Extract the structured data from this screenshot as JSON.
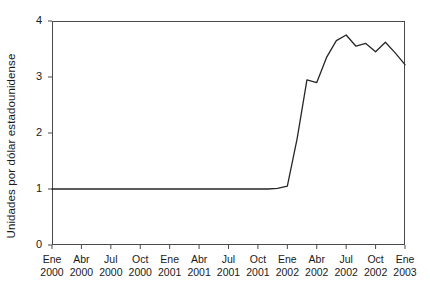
{
  "chart_data": {
    "type": "line",
    "title": "",
    "xlabel": "",
    "ylabel": "Unidades por dólar estadounidense",
    "ylim": [
      0,
      4
    ],
    "yticks": [
      0,
      1,
      2,
      3,
      4
    ],
    "ytick_labels": [
      "0",
      "1",
      "2",
      "3",
      "4"
    ],
    "grid": false,
    "legend": "none",
    "x_tick_labels": [
      {
        "month": "Ene",
        "year": "2000"
      },
      {
        "month": "Abr",
        "year": "2000"
      },
      {
        "month": "Jul",
        "year": "2000"
      },
      {
        "month": "Oct",
        "year": "2000"
      },
      {
        "month": "Ene",
        "year": "2001"
      },
      {
        "month": "Abr",
        "year": "2001"
      },
      {
        "month": "Jul",
        "year": "2001"
      },
      {
        "month": "Oct",
        "year": "2001"
      },
      {
        "month": "Ene",
        "year": "2002"
      },
      {
        "month": "Abr",
        "year": "2002"
      },
      {
        "month": "Jul",
        "year": "2002"
      },
      {
        "month": "Oct",
        "year": "2002"
      },
      {
        "month": "Ene",
        "year": "2003"
      }
    ],
    "x": [
      "2000-01",
      "2000-02",
      "2000-03",
      "2000-04",
      "2000-05",
      "2000-06",
      "2000-07",
      "2000-08",
      "2000-09",
      "2000-10",
      "2000-11",
      "2000-12",
      "2001-01",
      "2001-02",
      "2001-03",
      "2001-04",
      "2001-05",
      "2001-06",
      "2001-07",
      "2001-08",
      "2001-09",
      "2001-10",
      "2001-11",
      "2001-12",
      "2002-01",
      "2002-02",
      "2002-03",
      "2002-04",
      "2002-05",
      "2002-06",
      "2002-07",
      "2002-08",
      "2002-09",
      "2002-10",
      "2002-11",
      "2002-12",
      "2003-01"
    ],
    "series": [
      {
        "name": "Tipo de cambio",
        "color": "#262626",
        "values": [
          1.0,
          1.0,
          1.0,
          1.0,
          1.0,
          1.0,
          1.0,
          1.0,
          1.0,
          1.0,
          1.0,
          1.0,
          1.0,
          1.0,
          1.0,
          1.0,
          1.0,
          1.0,
          1.0,
          1.0,
          1.0,
          1.0,
          1.0,
          1.01,
          1.05,
          1.9,
          2.95,
          2.9,
          3.35,
          3.65,
          3.75,
          3.55,
          3.6,
          3.45,
          3.62,
          3.43,
          3.22
        ]
      }
    ]
  },
  "axis": {
    "frame_color": "#4a4a4a"
  }
}
